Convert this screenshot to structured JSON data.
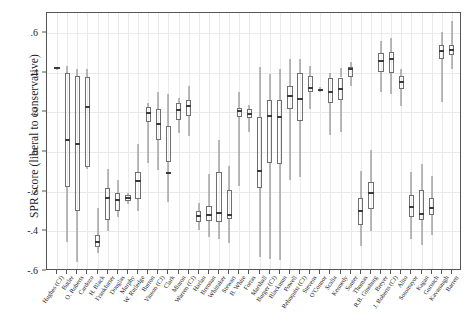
{
  "chart_data": {
    "type": "boxplot",
    "title": "",
    "xlabel": "",
    "ylabel": "SPR score (liberal to conservative)",
    "ylim": [
      -0.6,
      0.7
    ],
    "yticks": [
      0.6,
      0.4,
      0.2,
      0,
      -0.2,
      -0.4,
      -0.6
    ],
    "ytick_labels": [
      ".6",
      ".4",
      ".2",
      "0",
      "-.2",
      "-.4",
      "-.6"
    ],
    "grid": "both-light",
    "legend": "none",
    "categories": [
      "Hughes (CJ)",
      "Butler",
      "O. Roberts",
      "Cardozo",
      "H. Black",
      "Frankfurter",
      "Douglas",
      "Murphy",
      "W. Rutledge",
      "Burton",
      "Vinson (CJ)",
      "Clark",
      "Minton",
      "Warren (CJ)",
      "Harlan",
      "Brennan",
      "Whittaker",
      "Stewart",
      "B. White",
      "Fortas",
      "Marshall",
      "Burger (CJ)",
      "Blackmun",
      "Powell",
      "Rehnquist (CJ)",
      "Stevens",
      "O'Connor",
      "Scalia",
      "Kennedy",
      "Souter",
      "Thomas",
      "R.B. Ginsburg",
      "Breyer",
      "J. Roberts (CJ)",
      "Alito",
      "Sotomayor",
      "Kagan",
      "Gorsuch",
      "Kavanaugh",
      "Barrett"
    ],
    "boxes": [
      {
        "label": "Hughes (CJ)",
        "min": 0.415,
        "q1": 0.42,
        "med": 0.423,
        "q3": 0.426,
        "max": 0.43
      },
      {
        "label": "Butler",
        "min": -0.455,
        "q1": -0.175,
        "med": 0.06,
        "q3": 0.398,
        "max": 0.432
      },
      {
        "label": "O. Roberts",
        "min": -0.555,
        "q1": -0.3,
        "med": 0.042,
        "q3": 0.382,
        "max": 0.418
      },
      {
        "label": "Cardozo",
        "min": -0.085,
        "q1": -0.075,
        "med": 0.228,
        "q3": 0.378,
        "max": 0.418
      },
      {
        "label": "H. Black",
        "min": -0.51,
        "q1": -0.48,
        "med": -0.455,
        "q3": -0.42,
        "max": -0.285
      },
      {
        "label": "Frankfurter",
        "min": -0.4,
        "q1": -0.345,
        "med": -0.232,
        "q3": -0.18,
        "max": -0.088
      },
      {
        "label": "Douglas",
        "min": -0.33,
        "q1": -0.3,
        "med": -0.243,
        "q3": -0.205,
        "max": -0.14
      },
      {
        "label": "Murphy",
        "min": -0.262,
        "q1": -0.248,
        "med": -0.232,
        "q3": -0.218,
        "max": -0.205
      },
      {
        "label": "W. Rutledge",
        "min": -0.3,
        "q1": -0.235,
        "med": -0.148,
        "q3": -0.1,
        "max": 0.04
      },
      {
        "label": "Burton",
        "min": -0.055,
        "q1": 0.15,
        "med": 0.195,
        "q3": 0.225,
        "max": 0.245
      },
      {
        "label": "Vinson (CJ)",
        "min": -0.09,
        "q1": 0.06,
        "med": 0.142,
        "q3": 0.218,
        "max": 0.3
      },
      {
        "label": "Clark",
        "min": -0.25,
        "q1": -0.05,
        "med": -0.105,
        "q3": 0.13,
        "max": 0.29
      },
      {
        "label": "Minton",
        "min": 0.095,
        "q1": 0.16,
        "med": 0.21,
        "q3": 0.248,
        "max": 0.27
      },
      {
        "label": "Warren (CJ)",
        "min": 0.08,
        "q1": 0.182,
        "med": 0.23,
        "q3": 0.262,
        "max": 0.33
      },
      {
        "label": "Harlan",
        "min": -0.395,
        "q1": -0.355,
        "med": -0.322,
        "q3": -0.3,
        "max": -0.258
      },
      {
        "label": "Brennan",
        "min": -0.43,
        "q1": -0.35,
        "med": -0.318,
        "q3": -0.27,
        "max": -0.11
      },
      {
        "label": "Whittaker",
        "min": -0.44,
        "q1": -0.355,
        "med": -0.31,
        "q3": -0.1,
        "max": 0.06
      },
      {
        "label": "Stewart",
        "min": -0.46,
        "q1": -0.34,
        "med": -0.32,
        "q3": -0.19,
        "max": -0.07
      },
      {
        "label": "B. White",
        "min": -0.17,
        "q1": 0.175,
        "med": 0.205,
        "q3": 0.222,
        "max": 0.3
      },
      {
        "label": "Fortas",
        "min": 0.1,
        "q1": 0.172,
        "med": 0.19,
        "q3": 0.215,
        "max": 0.235
      },
      {
        "label": "Marshall",
        "min": -0.53,
        "q1": -0.18,
        "med": -0.095,
        "q3": 0.175,
        "max": 0.43
      },
      {
        "label": "Burger (CJ)",
        "min": -0.54,
        "q1": -0.055,
        "med": 0.182,
        "q3": 0.26,
        "max": 0.395
      },
      {
        "label": "Blackmun",
        "min": -0.545,
        "q1": -0.06,
        "med": 0.178,
        "q3": 0.262,
        "max": 0.42
      },
      {
        "label": "Powell",
        "min": -0.14,
        "q1": 0.215,
        "med": 0.282,
        "q3": 0.33,
        "max": 0.47
      },
      {
        "label": "Rehnquist (CJ)",
        "min": -0.125,
        "q1": 0.155,
        "med": 0.268,
        "q3": 0.4,
        "max": 0.47
      },
      {
        "label": "Stevens",
        "min": 0.215,
        "q1": 0.3,
        "med": 0.32,
        "q3": 0.385,
        "max": 0.435
      },
      {
        "label": "O'Connor",
        "min": 0.3,
        "q1": 0.308,
        "med": 0.312,
        "q3": 0.318,
        "max": 0.325
      },
      {
        "label": "Scalia",
        "min": 0.085,
        "q1": 0.245,
        "med": 0.3,
        "q3": 0.37,
        "max": 0.4
      },
      {
        "label": "Kennedy",
        "min": 0.1,
        "q1": 0.262,
        "med": 0.318,
        "q3": 0.375,
        "max": 0.425
      },
      {
        "label": "Souter",
        "min": 0.33,
        "q1": 0.38,
        "med": 0.42,
        "q3": 0.43,
        "max": 0.455
      },
      {
        "label": "Thomas",
        "min": -0.475,
        "q1": -0.37,
        "med": -0.3,
        "q3": -0.23,
        "max": -0.095
      },
      {
        "label": "R.B. Ginsburg",
        "min": -0.4,
        "q1": -0.29,
        "med": -0.205,
        "q3": -0.15,
        "max": 0.01
      },
      {
        "label": "Breyer",
        "min": 0.3,
        "q1": 0.405,
        "med": 0.46,
        "q3": 0.498,
        "max": 0.56
      },
      {
        "label": "J. Roberts (CJ)",
        "min": 0.29,
        "q1": 0.398,
        "med": 0.468,
        "q3": 0.505,
        "max": 0.575
      },
      {
        "label": "Alito",
        "min": 0.23,
        "q1": 0.318,
        "med": 0.352,
        "q3": 0.385,
        "max": 0.418
      },
      {
        "label": "Sotomayor",
        "min": -0.44,
        "q1": -0.33,
        "med": -0.28,
        "q3": -0.215,
        "max": -0.1
      },
      {
        "label": "Kagan",
        "min": -0.47,
        "q1": -0.345,
        "med": -0.312,
        "q3": -0.19,
        "max": -0.06
      },
      {
        "label": "Gorsuch",
        "min": -0.42,
        "q1": -0.32,
        "med": -0.282,
        "q3": -0.23,
        "max": -0.12
      },
      {
        "label": "Kavanaugh",
        "min": 0.25,
        "q1": 0.47,
        "med": 0.51,
        "q3": 0.54,
        "max": 0.605
      },
      {
        "label": "Barrett",
        "min": 0.42,
        "q1": 0.49,
        "med": 0.512,
        "q3": 0.54,
        "max": 0.66
      }
    ]
  }
}
